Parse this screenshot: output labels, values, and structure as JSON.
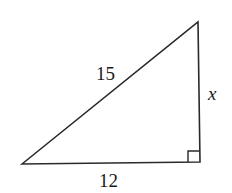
{
  "diagram": {
    "type": "right-triangle",
    "labels": {
      "hypotenuse": "15",
      "vertical_leg": "x",
      "horizontal_leg": "12"
    },
    "right_angle_marker": true,
    "stroke_color": "#2a2a2a"
  }
}
